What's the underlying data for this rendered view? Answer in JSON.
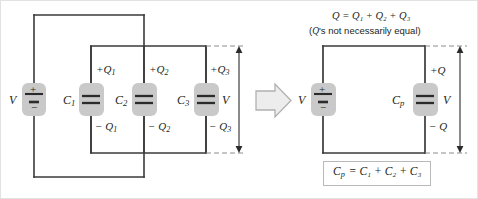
{
  "figure": {
    "colors": {
      "wire": "#3a3a3a",
      "text": "#231f20",
      "highlight": "#c9c9c9",
      "dashed": "#8c8c8c",
      "arrow_fill": "#ededed",
      "arrow_stroke": "#b0b0b0",
      "box_border": "#b9b9b9",
      "background": "#ffffff"
    }
  },
  "left_circuit": {
    "name": "three-capacitors-in-parallel",
    "source_label": "V",
    "battery": {
      "plus": "+",
      "minus": "−"
    },
    "capacitors": [
      {
        "name": "C1",
        "label": "C",
        "sub": "1",
        "charge_top": "+Q",
        "charge_top_sub": "1",
        "charge_bottom": "− Q",
        "charge_bottom_sub": "1"
      },
      {
        "name": "C2",
        "label": "C",
        "sub": "2",
        "charge_top": "+Q",
        "charge_top_sub": "2",
        "charge_bottom": "− Q",
        "charge_bottom_sub": "2"
      },
      {
        "name": "C3",
        "label": "C",
        "sub": "3",
        "charge_top": "+Q",
        "charge_top_sub": "3",
        "charge_bottom": "− Q",
        "charge_bottom_sub": "3"
      }
    ],
    "voltage_dimension_label": "V"
  },
  "transition": {
    "arrow_icon": "right-arrow-icon",
    "direction": "right"
  },
  "right_circuit": {
    "name": "equivalent-parallel-capacitor",
    "annotation_line1_prefix": "Q = Q",
    "annotation_line1": "Q = Q₁ + Q₂ + Q₃",
    "annotation_line2": "(Q's not necessarily equal)",
    "annotation_line2_italic_part": "Q",
    "annotation_line2_rest": "'s not necessarily equal)",
    "annotation_line2_open": "(",
    "source_label": "V",
    "battery": {
      "plus": "+",
      "minus": "−"
    },
    "capacitor": {
      "name": "Cp",
      "label": "C",
      "sub": "p",
      "charge_top": "+Q",
      "charge_bottom": "− Q"
    },
    "voltage_dimension_label": "V",
    "formula_box": {
      "text": "Cₚ = C₁ + C₂ + C₃",
      "lhs": "C",
      "lhs_sub": "p",
      "rhs": "= C₁ + C₂ + C₃"
    }
  }
}
